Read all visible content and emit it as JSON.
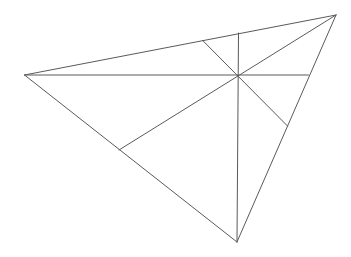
{
  "diagram": {
    "type": "triangle-with-cevians",
    "width": 351,
    "height": 257,
    "background": "#ffffff",
    "stroke_color": "#5a5a5a",
    "stroke_width": 1,
    "vertices": {
      "left": [
        24.5,
        75
      ],
      "top_right": [
        336,
        15
      ],
      "bottom": [
        237,
        242
      ]
    },
    "interior_point": [
      237.5,
      75
    ],
    "triangle_edges": [
      {
        "name": "edge-left-topright",
        "from": [
          24.5,
          75
        ],
        "to": [
          336,
          15
        ]
      },
      {
        "name": "edge-topright-bottom",
        "from": [
          336,
          15
        ],
        "to": [
          237,
          242
        ]
      },
      {
        "name": "edge-bottom-left",
        "from": [
          237,
          242
        ],
        "to": [
          24.5,
          75
        ]
      }
    ],
    "interior_segments": [
      {
        "name": "horizontal-segment",
        "from": [
          24.5,
          75
        ],
        "to": [
          308.5,
          75
        ]
      },
      {
        "name": "vertical-segment",
        "from": [
          238.5,
          33
        ],
        "to": [
          237,
          242
        ]
      },
      {
        "name": "diagonal-topright-segment",
        "from": [
          336,
          15
        ],
        "to": [
          119,
          150
        ]
      },
      {
        "name": "diagonal-topleft-segment",
        "from": [
          202.5,
          40.3
        ],
        "to": [
          287.5,
          126
        ]
      }
    ]
  }
}
